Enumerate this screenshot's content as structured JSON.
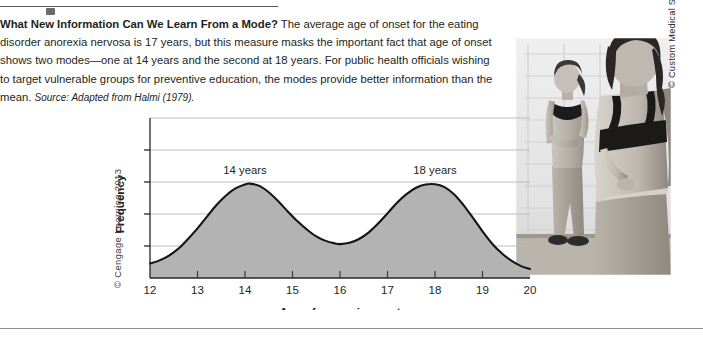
{
  "figure": {
    "caption": {
      "heading": "What New Information Can We Learn From a Mode?",
      "body": " The average age of onset for the eating disorder anorexia nervosa is 17 years, but this measure masks the important fact that age of onset shows two modes—one at 14 years and the second at 18 years. For public health officials wishing to target vulnerable groups for preventive education, the modes provide better information than the mean. ",
      "source_label": "Source:",
      "source_text": " Adapted from Halmi (1979)."
    },
    "cengage_credit": "© Cengage Learning 2013",
    "photo_credit": "© Custom Medical Stock Photo/Alamy",
    "photo_alt": "two-women-mirror-photo"
  },
  "colors": {
    "curve_stroke": "#1a1a1a",
    "area_fill": "#b3b3b3",
    "gridline": "#b9b9b9",
    "axis": "#2b2b2b",
    "text": "#231f20",
    "rule": "#5a5a5a"
  },
  "chart_data": {
    "type": "area",
    "title": "",
    "xlabel": "Age of anorexia onset",
    "ylabel": "Frequency",
    "xlim": [
      12,
      20
    ],
    "ylim": [
      0,
      5
    ],
    "xticks": [
      12,
      13,
      14,
      15,
      16,
      17,
      18,
      19,
      20
    ],
    "xticklabels": [
      "12",
      "13",
      "14",
      "15",
      "16",
      "17",
      "18",
      "19",
      "20"
    ],
    "yticks": [
      1,
      2,
      3,
      4
    ],
    "yticklabels": [
      "",
      "",
      "",
      ""
    ],
    "grid": true,
    "legend": "none",
    "annotations": [
      {
        "label": "14 years",
        "x": 14,
        "y": 3.05
      },
      {
        "label": "18 years",
        "x": 18,
        "y": 3.05
      }
    ],
    "x": [
      12.0,
      12.2,
      12.4,
      12.6,
      12.8,
      13.0,
      13.2,
      13.4,
      13.6,
      13.8,
      14.0,
      14.1,
      14.3,
      14.5,
      14.7,
      14.9,
      15.1,
      15.3,
      15.5,
      15.7,
      15.9,
      16.0,
      16.2,
      16.4,
      16.6,
      16.8,
      17.0,
      17.2,
      17.4,
      17.6,
      17.8,
      18.0,
      18.2,
      18.4,
      18.6,
      18.8,
      19.0,
      19.2,
      19.4,
      19.6,
      19.8,
      20.0
    ],
    "y": [
      0.45,
      0.55,
      0.7,
      0.92,
      1.22,
      1.55,
      1.92,
      2.28,
      2.58,
      2.8,
      2.92,
      2.95,
      2.88,
      2.68,
      2.4,
      2.08,
      1.78,
      1.52,
      1.3,
      1.16,
      1.08,
      1.06,
      1.1,
      1.22,
      1.42,
      1.7,
      2.02,
      2.35,
      2.62,
      2.82,
      2.92,
      2.93,
      2.84,
      2.62,
      2.28,
      1.88,
      1.46,
      1.08,
      0.78,
      0.55,
      0.38,
      0.28
    ],
    "series": [
      {
        "name": "Frequency of anorexia onset",
        "values": [
          0.45,
          0.55,
          0.7,
          0.92,
          1.22,
          1.55,
          1.92,
          2.28,
          2.58,
          2.8,
          2.92,
          2.95,
          2.88,
          2.68,
          2.4,
          2.08,
          1.78,
          1.52,
          1.3,
          1.16,
          1.08,
          1.06,
          1.1,
          1.22,
          1.42,
          1.7,
          2.02,
          2.35,
          2.62,
          2.82,
          2.92,
          2.93,
          2.84,
          2.62,
          2.28,
          1.88,
          1.46,
          1.08,
          0.78,
          0.55,
          0.38,
          0.28
        ]
      }
    ],
    "modes": [
      14,
      18
    ],
    "mean": 17
  }
}
